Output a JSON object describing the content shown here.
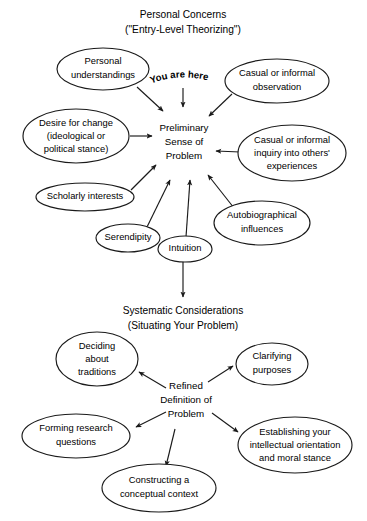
{
  "figure": {
    "background_color": "#ffffff",
    "ink_color": "#1a1a1a",
    "width": 367,
    "height": 521
  },
  "sections": {
    "top": {
      "title_line1": "Personal Concerns",
      "title_line2": "(\"Entry-Level Theorizing\")",
      "hub": {
        "line1": "Preliminary",
        "line2": "Sense of",
        "line3": "Problem"
      },
      "annotation": "You are here"
    },
    "bottom": {
      "title_line1": "Systematic Considerations",
      "title_line2": "(Situating Your Problem)",
      "hub": {
        "line1": "Refined",
        "line2": "Definition of",
        "line3": "Problem"
      }
    }
  },
  "top_nodes": [
    {
      "id": "personal-understandings",
      "line1": "Personal",
      "line2": "understandings",
      "line3": ""
    },
    {
      "id": "casual-informal-observation",
      "line1": "Casual or informal",
      "line2": "observation",
      "line3": ""
    },
    {
      "id": "desire-for-change",
      "line1": "Desire for change",
      "line2": "(ideological or",
      "line3": "political stance)"
    },
    {
      "id": "casual-informal-inquiry",
      "line1": "Casual or informal",
      "line2": "inquiry into others'",
      "line3": "experiences"
    },
    {
      "id": "scholarly-interests",
      "line1": "Scholarly interests",
      "line2": "",
      "line3": ""
    },
    {
      "id": "autobiographical-influences",
      "line1": "Autobiographical",
      "line2": "influences",
      "line3": ""
    },
    {
      "id": "serendipity",
      "line1": "Serendipity",
      "line2": "",
      "line3": ""
    },
    {
      "id": "intuition",
      "line1": "Intuition",
      "line2": "",
      "line3": ""
    }
  ],
  "bottom_nodes": [
    {
      "id": "deciding-about-traditions",
      "line1": "Deciding",
      "line2": "about",
      "line3": "traditions"
    },
    {
      "id": "clarifying-purposes",
      "line1": "Clarifying",
      "line2": "purposes",
      "line3": ""
    },
    {
      "id": "forming-research-questions",
      "line1": "Forming research",
      "line2": "questions",
      "line3": ""
    },
    {
      "id": "establishing-orientation",
      "line1": "Establishing your",
      "line2": "intellectual orientation",
      "line3": "and moral stance"
    },
    {
      "id": "constructing-conceptual-context",
      "line1": "Constructing a",
      "line2": "conceptual context",
      "line3": ""
    }
  ],
  "here_letters": [
    "Y",
    "o",
    "u",
    " ",
    "a",
    "r",
    "e",
    " ",
    "h",
    "e",
    "r",
    "e"
  ]
}
